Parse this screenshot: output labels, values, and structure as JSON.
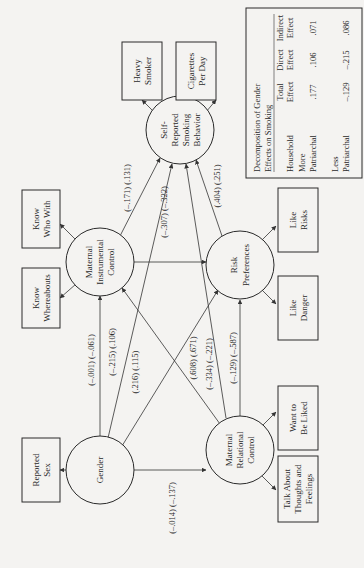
{
  "diagram": {
    "orientation": "rotated-90-ccw",
    "latent_variables": {
      "gender": "Gender",
      "mic": [
        "Maternal",
        "Instrumental",
        "Control"
      ],
      "smoking": [
        "Self-",
        "Reported",
        "Smoking",
        "Behavior"
      ],
      "risk": [
        "Risk",
        "Preferences"
      ],
      "mrc": [
        "Maternal",
        "Relational",
        "Control"
      ]
    },
    "indicators": {
      "reported_sex": [
        "Reported",
        "Sex"
      ],
      "know_who_with": [
        "Know",
        "Who With"
      ],
      "know_whereabouts": [
        "Know",
        "Whereabouts"
      ],
      "heavy_smoker": [
        "Heavy",
        "Smoker"
      ],
      "cigarettes_per_day": [
        "Cigarettes",
        "Per Day"
      ],
      "like_risks": [
        "Like",
        "Risks"
      ],
      "like_danger": [
        "Like",
        "Danger"
      ],
      "want_to_be_liked": [
        "Want to",
        "Be Liked"
      ],
      "talk_about": [
        "Talk About",
        "Thoughts and",
        "Feelings"
      ]
    },
    "paths": {
      "gender_mic": "(–.001) (–.061)",
      "gender_smoking": "(–.215) (.106)",
      "gender_risk": "(.216) (.115)",
      "gender_mrc": "(–.014) (–.137)",
      "mic_smoking": "(–.171) (.131)",
      "mic_risk": "(–.307) (–.322)",
      "mrc_mic": "(.608) (.671)",
      "mrc_smoking": "(–.334) (–.221)",
      "mrc_risk": "(–.129) (–.587)",
      "risk_smoking": "(.404) (.251)"
    },
    "table": {
      "title": [
        "Decomposition of Gender",
        "Effects on Smoking"
      ],
      "headers": {
        "row_label": "Household",
        "total": [
          "Total",
          "Effect"
        ],
        "direct": [
          "Direct",
          "Effect"
        ],
        "indirect": [
          "Indirect",
          "Effect"
        ]
      },
      "rows": [
        {
          "label": [
            "More",
            "Patriarchal"
          ],
          "total": ".177",
          "direct": ".106",
          "indirect": ".071"
        },
        {
          "label": [
            "Less",
            "Patriarchal"
          ],
          "total": "–.129",
          "direct": "–.215",
          "indirect": ".086"
        }
      ]
    }
  }
}
